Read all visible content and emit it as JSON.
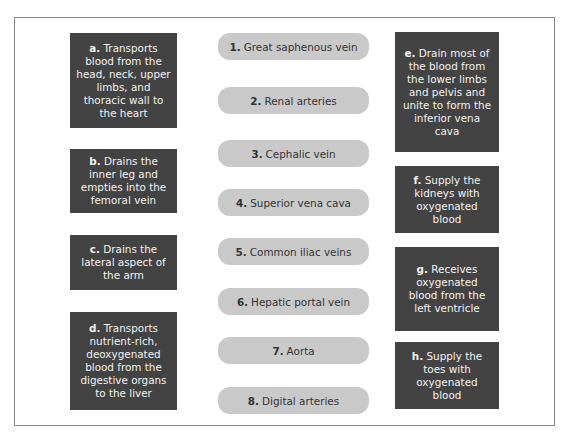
{
  "matching_exercise": {
    "left_descriptions": [
      {
        "letter": "a.",
        "text": "Transports blood from the head, neck, upper limbs, and thoracic wall to the heart"
      },
      {
        "letter": "b.",
        "text": "Drains the inner leg and empties into the femoral vein"
      },
      {
        "letter": "c.",
        "text": "Drains the lateral aspect of the arm"
      },
      {
        "letter": "d.",
        "text": "Transports nutrient-rich, deoxygenated blood from the digestive organs to the liver"
      }
    ],
    "terms": [
      {
        "number": "1.",
        "text": "Great saphenous vein"
      },
      {
        "number": "2.",
        "text": "Renal arteries"
      },
      {
        "number": "3.",
        "text": "Cephalic vein"
      },
      {
        "number": "4.",
        "text": "Superior vena cava"
      },
      {
        "number": "5.",
        "text": "Common iliac veins"
      },
      {
        "number": "6.",
        "text": "Hepatic portal vein"
      },
      {
        "number": "7.",
        "text": "Aorta"
      },
      {
        "number": "8.",
        "text": "Digital arteries"
      }
    ],
    "right_descriptions": [
      {
        "letter": "e.",
        "text": "Drain most of the blood from the lower limbs and pelvis and unite to form the inferior vena cava"
      },
      {
        "letter": "f.",
        "text": "Supply the kidneys with oxygenated blood"
      },
      {
        "letter": "g.",
        "text": "Receives oxygenated blood from the left ventricle"
      },
      {
        "letter": "h.",
        "text": "Supply the toes with oxygenated blood"
      }
    ]
  },
  "colors": {
    "description_box": "#434343",
    "description_text": "#f2f2f2",
    "term_pill": "#c9c9c9",
    "term_text": "#333333",
    "frame_border": "#8a8a8a"
  }
}
